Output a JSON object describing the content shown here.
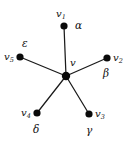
{
  "figure": {
    "background_color": "#ffffff",
    "node_color": "#0a0a0a",
    "edge_color": "#1a1a1a",
    "text_color": "#111111",
    "width": 134,
    "height": 142
  },
  "center": {
    "id": "v",
    "label": "v",
    "cx": 66,
    "cy": 76,
    "r": 4.2
  },
  "leaves": [
    {
      "id": "v1",
      "label_base": "v",
      "label_sub": "1",
      "edge_label": "α",
      "cx": 64,
      "cy": 26,
      "r": 3.6,
      "vlabel_x": 56,
      "vlabel_y": 9,
      "elabel_x": 75,
      "elabel_y": 20
    },
    {
      "id": "v2",
      "label_base": "v",
      "label_sub": "2",
      "edge_label": "β",
      "cx": 107,
      "cy": 58,
      "r": 3.6,
      "vlabel_x": 113,
      "vlabel_y": 53,
      "elabel_x": 103,
      "elabel_y": 68
    },
    {
      "id": "v3",
      "label_base": "v",
      "label_sub": "3",
      "edge_label": "γ",
      "cx": 89,
      "cy": 114,
      "r": 3.6,
      "vlabel_x": 95,
      "vlabel_y": 109,
      "elabel_x": 86,
      "elabel_y": 125
    },
    {
      "id": "v4",
      "label_base": "v",
      "label_sub": "4",
      "edge_label": "δ",
      "cx": 37,
      "cy": 113,
      "r": 3.6,
      "vlabel_x": 21,
      "vlabel_y": 108,
      "elabel_x": 33,
      "elabel_y": 124
    },
    {
      "id": "v5",
      "label_base": "v",
      "label_sub": "5",
      "edge_label": "ε",
      "cx": 20,
      "cy": 57,
      "r": 3.6,
      "vlabel_x": 4,
      "vlabel_y": 52,
      "elabel_x": 22,
      "elabel_y": 38
    }
  ],
  "center_label_pos": {
    "x": 70,
    "y": 58
  }
}
